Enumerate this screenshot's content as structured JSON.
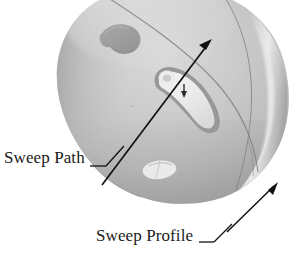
{
  "figure": {
    "kind": "technical-illustration",
    "background_color": "#ffffff",
    "annotations": [
      {
        "id": "sweep-path",
        "label": "Sweep Path",
        "leader": "horizontal-then-diagonal-to-upper-right",
        "points_to": "arrow-along-helmet-surface"
      },
      {
        "id": "sweep-profile",
        "label": "Sweep Profile",
        "leader": "horizontal-then-diagonal-to-upper-right",
        "points_to": "helmet-rim-right-edge"
      }
    ],
    "colors": {
      "line": "#1a1a1a",
      "text": "#1a1a1a",
      "shell_light": "#d8d8d8",
      "shell_mid": "#b9b9b9",
      "shell_dark": "#9a9a9a",
      "shell_shadow": "#818181",
      "highlight": "#f2f2f2",
      "vent_dark": "#8e8e8e",
      "seam": "#6e6e6e"
    }
  },
  "labels": {
    "sweep_path": "Sweep Path",
    "sweep_profile": "Sweep Profile"
  }
}
